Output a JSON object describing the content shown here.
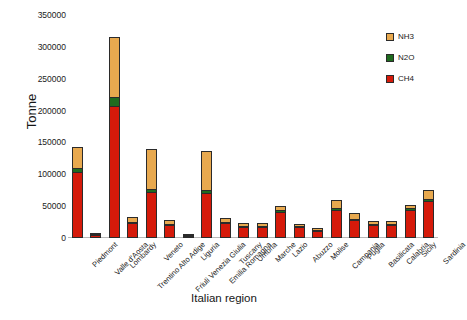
{
  "chart_data": {
    "type": "bar",
    "stacked": true,
    "title": "",
    "xlabel": "Italian region",
    "ylabel": "Tonne",
    "ylim": [
      0,
      350000
    ],
    "yticks": [
      0,
      50000,
      100000,
      150000,
      200000,
      250000,
      300000,
      350000
    ],
    "ytick_labels": [
      "0",
      "50000",
      "100000",
      "150000",
      "200000",
      "250000",
      "300000",
      "350000"
    ],
    "grid": false,
    "legend_position": "top-right",
    "categories": [
      "Piedmont",
      "Valle d'Aosta",
      "Lombardy",
      "Trentino Alto Adige",
      "Veneto",
      "Friuli Venezia Giulia",
      "Liguria",
      "Emilia Romagna",
      "Tuscany",
      "Umbria",
      "Marche",
      "Lazio",
      "Abuzzo",
      "Molise",
      "Campania",
      "Puglia",
      "Basilicata",
      "Calabria",
      "Sicily",
      "Sardinia"
    ],
    "series": [
      {
        "name": "CH4",
        "color": "#d51a0a",
        "values": [
          103000,
          4000,
          207000,
          24000,
          72000,
          21000,
          2500,
          70000,
          24000,
          17000,
          17000,
          41000,
          17000,
          11000,
          44000,
          28000,
          20000,
          20000,
          44000,
          58000
        ]
      },
      {
        "name": "N2O",
        "color": "#1f6b1f",
        "values": [
          7000,
          300,
          14000,
          1500,
          5000,
          1500,
          200,
          5000,
          1500,
          1200,
          1200,
          2500,
          1200,
          700,
          2500,
          2000,
          1500,
          1200,
          2500,
          3500
        ]
      },
      {
        "name": "NH3",
        "color": "#e8a94f",
        "values": [
          33000,
          1200,
          95000,
          7500,
          63000,
          5500,
          500,
          62000,
          6500,
          5000,
          5000,
          7000,
          4000,
          2500,
          12500,
          9000,
          4500,
          5000,
          5500,
          13500
        ]
      }
    ],
    "totals": [
      143000,
      5500,
      316000,
      33000,
      140000,
      28000,
      3200,
      137000,
      32000,
      23200,
      23200,
      50500,
      22200,
      14200,
      59000,
      39000,
      26000,
      26200,
      52000,
      75000
    ]
  },
  "legend": {
    "entries": [
      {
        "label": "NH3",
        "color": "#e8a94f"
      },
      {
        "label": "N2O",
        "color": "#1f6b1f"
      },
      {
        "label": "CH4",
        "color": "#d51a0a"
      }
    ]
  }
}
